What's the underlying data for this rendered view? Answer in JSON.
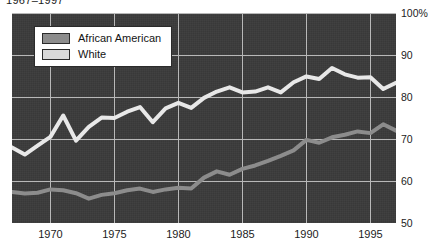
{
  "caption": {
    "text": "1967–1997"
  },
  "legend": {
    "position": "top-left",
    "items": [
      {
        "label": "African American",
        "color": "#8c8c8c",
        "swatch_name": "legend-swatch-african-american"
      },
      {
        "label": "White",
        "color": "#d9d9d9",
        "swatch_name": "legend-swatch-white"
      }
    ]
  },
  "axes": {
    "y_ticks": [
      "100%",
      "90",
      "80",
      "70",
      "60",
      "50"
    ],
    "y_tick_values": [
      100,
      90,
      80,
      70,
      60,
      50
    ],
    "x_ticks": [
      "1970",
      "1975",
      "1980",
      "1985",
      "1990",
      "1995"
    ],
    "x_tick_values": [
      1970,
      1975,
      1980,
      1985,
      1990,
      1995
    ]
  },
  "colors": {
    "plot_background": "#3b3b3b",
    "gridline": "#b8b8b8",
    "african_american_line": "#8c8c8c",
    "white_line": "#e8e8e8",
    "text": "#1c1c1c"
  },
  "chart_data": {
    "type": "line",
    "title": "1967–1997",
    "xlabel": "",
    "ylabel": "",
    "xlim": [
      1967,
      1997
    ],
    "ylim": [
      50,
      100
    ],
    "grid": true,
    "legend_position": "top-left",
    "x": [
      1967,
      1968,
      1969,
      1970,
      1971,
      1972,
      1973,
      1974,
      1975,
      1976,
      1977,
      1978,
      1979,
      1980,
      1981,
      1982,
      1983,
      1984,
      1985,
      1986,
      1987,
      1988,
      1989,
      1990,
      1991,
      1992,
      1993,
      1994,
      1995,
      1996,
      1997
    ],
    "series": [
      {
        "name": "White",
        "color": "#e8e8e8",
        "values": [
          68.0,
          66.3,
          68.4,
          70.5,
          75.6,
          69.6,
          72.9,
          75.1,
          75.0,
          76.5,
          77.6,
          74.0,
          77.3,
          78.6,
          77.4,
          79.8,
          81.3,
          82.3,
          81.1,
          81.3,
          82.3,
          81.1,
          83.5,
          84.9,
          84.3,
          86.9,
          85.4,
          84.6,
          84.7,
          81.9,
          83.4
        ]
      },
      {
        "name": "African American",
        "color": "#8c8c8c",
        "values": [
          57.4,
          57.0,
          57.2,
          58.0,
          57.8,
          57.1,
          55.8,
          56.7,
          57.1,
          57.8,
          58.2,
          57.4,
          58.0,
          58.4,
          58.2,
          60.8,
          62.3,
          61.5,
          62.9,
          63.7,
          64.8,
          66.0,
          67.3,
          69.8,
          69.1,
          70.4,
          71.0,
          71.8,
          71.4,
          73.5,
          72.0
        ]
      }
    ]
  }
}
